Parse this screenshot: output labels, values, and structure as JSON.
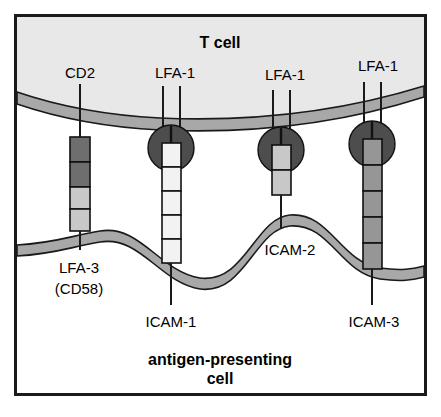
{
  "figure": {
    "title_top": "T cell",
    "title_bottom_line1": "antigen-presenting",
    "title_bottom_line2": "cell"
  },
  "colors": {
    "frame_border": "#1a1a1a",
    "tcell_fill": "#e8e8e8",
    "apc_fill": "#ffffff",
    "membrane_fill": "#a8a8a8",
    "membrane_stroke": "#1a1a1a",
    "receptor_dark": "#4d4d4d",
    "segment_dark": "#6e6e6e",
    "segment_mid": "#969696",
    "segment_light": "#c8c8c8",
    "segment_white": "#f2f2f2",
    "stalk": "#1a1a1a"
  },
  "tcell_labels": [
    {
      "id": "cd2",
      "text": "CD2",
      "x": 80,
      "y": 80
    },
    {
      "id": "lfa1-a",
      "text": "LFA-1",
      "x": 175,
      "y": 80
    },
    {
      "id": "lfa1-b",
      "text": "LFA-1",
      "x": 283,
      "y": 82
    },
    {
      "id": "lfa1-c",
      "text": "LFA-1",
      "x": 377,
      "y": 73
    }
  ],
  "apc_labels": [
    {
      "id": "lfa3",
      "text": "LFA-3",
      "x": 79,
      "y": 268,
      "anchor": "middle"
    },
    {
      "id": "cd58",
      "text": "(CD58)",
      "x": 79,
      "y": 289,
      "anchor": "middle"
    },
    {
      "id": "icam1",
      "text": "ICAM-1",
      "x": 171,
      "y": 325,
      "anchor": "middle"
    },
    {
      "id": "icam2",
      "text": "ICAM-2",
      "x": 287,
      "y": 253,
      "anchor": "middle"
    },
    {
      "id": "icam3",
      "text": "ICAM-3",
      "x": 374,
      "y": 325,
      "anchor": "middle"
    }
  ],
  "complexes": [
    {
      "id": "cd2-lfa3",
      "tcell_receptor": "CD2",
      "apc_receptor": "LFA-3 (CD58)",
      "receptor_shape": "rod",
      "stalk_x": 80,
      "segments": [
        {
          "fill": "#6e6e6e"
        },
        {
          "fill": "#6e6e6e"
        },
        {
          "fill": "#c8c8c8"
        },
        {
          "fill": "#c8c8c8"
        }
      ]
    },
    {
      "id": "lfa1-icam1",
      "tcell_receptor": "LFA-1",
      "apc_receptor": "ICAM-1",
      "receptor_shape": "lobed-circle",
      "stalk_x": 171,
      "segments": [
        {
          "fill": "#f2f2f2"
        },
        {
          "fill": "#f2f2f2"
        },
        {
          "fill": "#f2f2f2"
        },
        {
          "fill": "#f2f2f2"
        },
        {
          "fill": "#f2f2f2"
        }
      ]
    },
    {
      "id": "lfa1-icam2",
      "tcell_receptor": "LFA-1",
      "apc_receptor": "ICAM-2",
      "receptor_shape": "lobed-circle",
      "stalk_x": 281,
      "segments": [
        {
          "fill": "#c8c8c8"
        },
        {
          "fill": "#c8c8c8"
        }
      ]
    },
    {
      "id": "lfa1-icam3",
      "tcell_receptor": "LFA-1",
      "apc_receptor": "ICAM-3",
      "receptor_shape": "lobed-circle",
      "stalk_x": 372,
      "segments": [
        {
          "fill": "#969696"
        },
        {
          "fill": "#969696"
        },
        {
          "fill": "#969696"
        },
        {
          "fill": "#969696"
        },
        {
          "fill": "#969696"
        }
      ]
    }
  ]
}
